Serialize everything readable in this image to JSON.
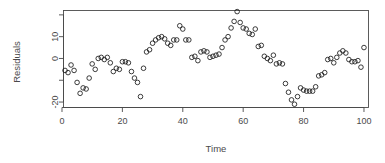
{
  "chart_data": {
    "type": "scatter",
    "title": "",
    "xlabel": "Time",
    "ylabel": "Residuals",
    "xlim": [
      0.5,
      101.5
    ],
    "ylim": [
      -22.5,
      22.0
    ],
    "xticks": [
      0,
      20,
      40,
      60,
      80,
      100
    ],
    "yticks": [
      -20,
      0,
      10
    ],
    "yticks_unlabeled": [
      -10,
      20
    ],
    "grid": false,
    "legend": null,
    "point_marker": "open-circle",
    "point_color": "#1a1a1a",
    "box": true,
    "x": [
      1,
      2,
      3,
      4,
      5,
      6,
      7,
      8,
      9,
      10,
      11,
      12,
      13,
      14,
      15,
      16,
      17,
      18,
      19,
      20,
      21,
      22,
      23,
      24,
      25,
      26,
      27,
      28,
      29,
      30,
      31,
      32,
      33,
      34,
      35,
      36,
      37,
      38,
      39,
      40,
      41,
      42,
      43,
      44,
      45,
      46,
      47,
      48,
      49,
      50,
      51,
      52,
      53,
      54,
      55,
      56,
      57,
      58,
      59,
      60,
      61,
      62,
      63,
      64,
      65,
      66,
      67,
      68,
      69,
      70,
      71,
      72,
      73,
      74,
      75,
      76,
      77,
      78,
      79,
      80,
      81,
      82,
      83,
      84,
      85,
      86,
      87,
      88,
      89,
      90,
      91,
      92,
      93,
      94,
      95,
      96,
      97,
      98,
      99,
      100
    ],
    "y": [
      -5.5,
      -6.5,
      -3.0,
      -5.5,
      -11.0,
      -16.0,
      -13.5,
      -14.0,
      -9.0,
      -2.5,
      -5.0,
      0.0,
      0.5,
      -0.5,
      0.5,
      -2.0,
      -6.0,
      -4.5,
      -5.0,
      -1.5,
      -1.5,
      -2.0,
      -6.0,
      -9.0,
      -11.0,
      -17.5,
      -4.5,
      3.0,
      4.0,
      7.0,
      8.5,
      9.5,
      10.0,
      9.0,
      7.0,
      6.0,
      8.5,
      8.5,
      15.0,
      13.5,
      8.5,
      8.5,
      0.5,
      1.0,
      -1.0,
      3.0,
      3.5,
      3.0,
      0.5,
      1.0,
      1.5,
      2.0,
      5.0,
      8.5,
      10.0,
      14.0,
      17.0,
      21.5,
      16.5,
      14.0,
      13.5,
      11.5,
      11.0,
      13.5,
      5.5,
      6.0,
      1.0,
      0.0,
      -1.0,
      1.5,
      -2.5,
      -2.0,
      -2.5,
      -11.5,
      -15.5,
      -19.0,
      -21.0,
      -17.5,
      -13.5,
      -14.5,
      -15.0,
      -15.0,
      -15.0,
      -13.0,
      -8.0,
      -7.5,
      -6.5,
      -0.5,
      0.0,
      -2.0,
      0.5,
      2.5,
      3.5,
      2.5,
      -0.5,
      -1.5,
      -1.5,
      -1.0,
      -4.0,
      5.0,
      -1.0
    ]
  },
  "axis": {
    "xlabel": "Time",
    "ylabel": "Residuals",
    "xtick_labels": [
      "0",
      "20",
      "40",
      "60",
      "80",
      "100"
    ],
    "ytick_labels": [
      "-20",
      "0",
      "10"
    ]
  },
  "style": {
    "axis_color": "#4a4a4a",
    "point_color": "#1a1a1a",
    "background": "#ffffff"
  }
}
